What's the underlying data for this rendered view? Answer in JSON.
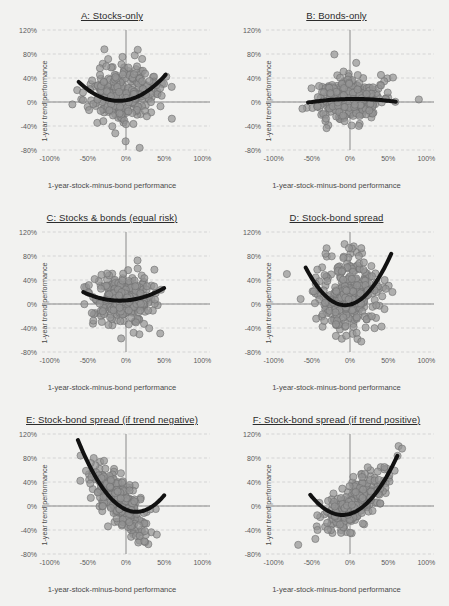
{
  "figure": {
    "background": "#f2f2f0",
    "point_color": "#949494",
    "point_edge_color": "#6f6f6f",
    "trend_color": "#111111",
    "grid_color": "#c9c9c9",
    "axis_color": "#8a8a8a"
  },
  "axes_common": {
    "xlabel": "1-year-stock-minus-bond performance",
    "ylabel": "1-year trend performance",
    "xticks": [
      "-100%",
      "-50%",
      "0%",
      "50%",
      "100%"
    ],
    "xtick_values": [
      -100,
      -50,
      0,
      50,
      100
    ],
    "yticks": [
      "120%",
      "80%",
      "40%",
      "0%",
      "-40%",
      "-80%"
    ],
    "ytick_values": [
      120,
      80,
      40,
      0,
      -40,
      -80
    ],
    "xlim": [
      -110,
      110
    ],
    "ylim": [
      -80,
      120
    ],
    "grid": true,
    "legend": "none"
  },
  "chart_data": [
    {
      "id": "A",
      "type": "scatter",
      "title": "A: Stocks-only",
      "xlabel": "1-year-stock-minus-bond performance",
      "ylabel": "1-year trend performance",
      "xlim": [
        -110,
        110
      ],
      "ylim": [
        -80,
        120
      ],
      "n_points": 300,
      "cloud": {
        "x_center": -2,
        "x_spread": 22,
        "y_center": 14,
        "y_spread": 26,
        "corr": 0.08,
        "seed": 11
      },
      "trend": {
        "kind": "quadratic",
        "a": 0.0115,
        "b": 0.22,
        "c": 3,
        "x_from": -62,
        "x_to": 52
      },
      "series_name": "Stocks-only"
    },
    {
      "id": "B",
      "type": "scatter",
      "title": "B: Bonds-only",
      "xlabel": "1-year-stock-minus-bond performance",
      "ylabel": "1-year trend performance",
      "xlim": [
        -110,
        110
      ],
      "ylim": [
        -80,
        120
      ],
      "n_points": 300,
      "cloud": {
        "x_center": 0,
        "x_spread": 22,
        "y_center": 8,
        "y_spread": 19,
        "corr": 0.05,
        "seed": 23
      },
      "trend": {
        "kind": "quadratic",
        "a": -0.0016,
        "b": 0.02,
        "c": 5,
        "x_from": -55,
        "x_to": 60
      },
      "series_name": "Bonds-only"
    },
    {
      "id": "C",
      "type": "scatter",
      "title": "C: Stocks & bonds (equal risk)",
      "xlabel": "1-year-stock-minus-bond performance",
      "ylabel": "1-year trend performance",
      "xlim": [
        -110,
        110
      ],
      "ylim": [
        -80,
        120
      ],
      "n_points": 300,
      "cloud": {
        "x_center": -1,
        "x_spread": 21,
        "y_center": 10,
        "y_spread": 21,
        "corr": 0.06,
        "seed": 37
      },
      "trend": {
        "kind": "quadratic",
        "a": 0.0062,
        "b": 0.1,
        "c": 6,
        "x_from": -56,
        "x_to": 50
      },
      "series_name": "Stocks & bonds (equal risk)"
    },
    {
      "id": "D",
      "type": "scatter",
      "title": "D: Stock-bond spread",
      "xlabel": "1-year-stock-minus-bond performance",
      "ylabel": "1-year trend performance",
      "xlim": [
        -110,
        110
      ],
      "ylim": [
        -80,
        120
      ],
      "n_points": 320,
      "cloud": {
        "x_center": -2,
        "x_spread": 21,
        "y_center": 16,
        "y_spread": 31,
        "corr": 0.05,
        "seed": 53
      },
      "trend": {
        "kind": "quadratic",
        "a": 0.0235,
        "b": 0.3,
        "c": -1,
        "x_from": -58,
        "x_to": 54
      },
      "series_name": "Stock-bond spread"
    },
    {
      "id": "E",
      "type": "scatter",
      "title": "E: Stock-bond spread (if trend negative)",
      "xlabel": "1-year-stock-minus-bond performance",
      "ylabel": "1-year trend performance",
      "xlim": [
        -110,
        110
      ],
      "ylim": [
        -80,
        120
      ],
      "n_points": 300,
      "cloud": {
        "x_center": -10,
        "x_spread": 19,
        "y_center": 10,
        "y_spread": 28,
        "corr": -0.72,
        "seed": 67
      },
      "trend": {
        "kind": "quadratic",
        "a": 0.0205,
        "b": -0.55,
        "c": -6,
        "x_from": -63,
        "x_to": 50
      },
      "series_name": "Stock-bond spread (if trend negative)"
    },
    {
      "id": "F",
      "type": "scatter",
      "title": "F: Stock-bond spread (if trend positive)",
      "xlabel": "1-year-stock-minus-bond performance",
      "ylabel": "1-year trend performance",
      "xlim": [
        -110,
        110
      ],
      "ylim": [
        -80,
        120
      ],
      "n_points": 300,
      "cloud": {
        "x_center": 6,
        "x_spread": 21,
        "y_center": 6,
        "y_spread": 27,
        "corr": 0.76,
        "seed": 89
      },
      "trend": {
        "kind": "quadratic",
        "a": 0.019,
        "b": 0.38,
        "c": -13,
        "x_from": -52,
        "x_to": 62
      },
      "series_name": "Stock-bond spread (if trend positive)"
    }
  ]
}
